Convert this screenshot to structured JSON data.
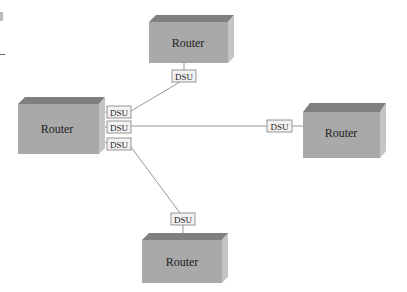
{
  "diagram": {
    "type": "network-topology",
    "colors": {
      "router_front": "#a9a9a9",
      "router_top": "#7f7f7f",
      "router_side": "#c4c4c4",
      "dsu_fill": "#f2f2f2",
      "dsu_border": "#8a8a8a",
      "link": "#8c8c8c",
      "text": "#222222"
    },
    "routers": [
      {
        "id": "router-top",
        "label": "Router"
      },
      {
        "id": "router-left",
        "label": "Router"
      },
      {
        "id": "router-right",
        "label": "Router"
      },
      {
        "id": "router-bottom",
        "label": "Router"
      }
    ],
    "dsus": [
      {
        "id": "dsu-top",
        "label": "DSU"
      },
      {
        "id": "dsu-left-1",
        "label": "DSU"
      },
      {
        "id": "dsu-left-2",
        "label": "DSU"
      },
      {
        "id": "dsu-left-3",
        "label": "DSU"
      },
      {
        "id": "dsu-right",
        "label": "DSU"
      },
      {
        "id": "dsu-bottom",
        "label": "DSU"
      }
    ],
    "links": [
      {
        "from": "dsu-left-1",
        "to": "dsu-top"
      },
      {
        "from": "dsu-left-2",
        "to": "dsu-right"
      },
      {
        "from": "dsu-left-3",
        "to": "dsu-bottom"
      }
    ]
  }
}
